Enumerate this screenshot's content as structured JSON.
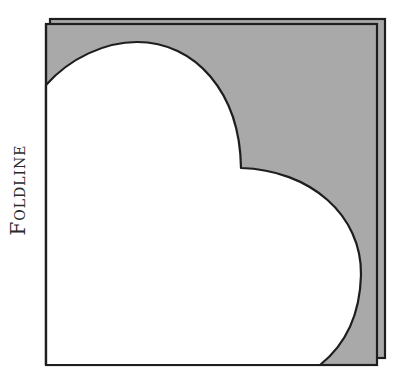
{
  "diagram": {
    "label": "Foldline",
    "colors": {
      "paper_fill": "#a9a9a9",
      "cutout_fill": "#ffffff",
      "outline": "#1e1e1e",
      "background": "#ffffff"
    },
    "elements": [
      {
        "name": "back-sheet",
        "shape": "square",
        "description": "Rear folded paper layer, offset up-right"
      },
      {
        "name": "front-sheet",
        "shape": "square",
        "description": "Front gray paper layer"
      },
      {
        "name": "heart-half-cutout",
        "shape": "half-heart",
        "description": "White half-heart shape aligned to fold line on left edge"
      }
    ]
  }
}
